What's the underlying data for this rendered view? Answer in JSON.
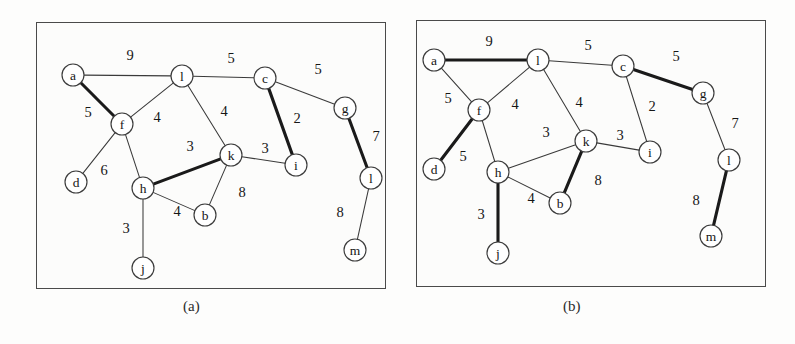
{
  "figure": {
    "title_a": "(a)",
    "title_b": "(b)",
    "node_radius": 11,
    "colors": {
      "edge_thin": "#3a3a3a",
      "edge_bold": "#1a1a1a",
      "node_fill": "#ffffff",
      "node_stroke": "#3b3b3b",
      "panel_border": "#4a4a4a",
      "background": "#fdfdfc"
    }
  },
  "chart_data": {
    "type": "diagram",
    "panels": [
      {
        "id": "a",
        "caption": "(a)",
        "nodes": [
          {
            "id": "a",
            "label": "a",
            "x": 73,
            "y": 75
          },
          {
            "id": "l",
            "label": "l",
            "x": 182,
            "y": 76
          },
          {
            "id": "c",
            "label": "c",
            "x": 265,
            "y": 78
          },
          {
            "id": "g",
            "label": "g",
            "x": 345,
            "y": 108
          },
          {
            "id": "f",
            "label": "f",
            "x": 122,
            "y": 124
          },
          {
            "id": "k",
            "label": "k",
            "x": 231,
            "y": 155
          },
          {
            "id": "i",
            "label": "i",
            "x": 296,
            "y": 165
          },
          {
            "id": "d",
            "label": "d",
            "x": 76,
            "y": 182
          },
          {
            "id": "h",
            "label": "h",
            "x": 143,
            "y": 188
          },
          {
            "id": "l2",
            "label": "l",
            "x": 371,
            "y": 178
          },
          {
            "id": "b",
            "label": "b",
            "x": 205,
            "y": 215
          },
          {
            "id": "m",
            "label": "m",
            "x": 355,
            "y": 250
          },
          {
            "id": "j",
            "label": "j",
            "x": 143,
            "y": 268
          }
        ],
        "edges": [
          {
            "from": "a",
            "to": "l",
            "weight": 9,
            "bold": false,
            "lx": 130,
            "ly": 55
          },
          {
            "from": "l",
            "to": "c",
            "weight": 5,
            "bold": false,
            "lx": 231,
            "ly": 58
          },
          {
            "from": "c",
            "to": "g",
            "weight": 5,
            "bold": false,
            "lx": 318,
            "ly": 69
          },
          {
            "from": "a",
            "to": "f",
            "weight": 5,
            "bold": true,
            "lx": 88,
            "ly": 112
          },
          {
            "from": "f",
            "to": "l",
            "weight": 4,
            "bold": false,
            "lx": 157,
            "ly": 117
          },
          {
            "from": "l",
            "to": "k",
            "weight": 4,
            "bold": false,
            "lx": 224,
            "ly": 111
          },
          {
            "from": "c",
            "to": "i",
            "weight": 2,
            "bold": true,
            "lx": 297,
            "ly": 118
          },
          {
            "from": "g",
            "to": "l2",
            "weight": 7,
            "bold": true,
            "lx": 376,
            "ly": 136
          },
          {
            "from": "f",
            "to": "d",
            "weight": 6,
            "bold": false,
            "lx": 104,
            "ly": 170
          },
          {
            "from": "f",
            "to": "h",
            "weight": 4,
            "bold": false,
            "lx": 157,
            "ly": 117
          },
          {
            "from": "h",
            "to": "k",
            "weight": 3,
            "bold": true,
            "lx": 190,
            "ly": 146
          },
          {
            "from": "k",
            "to": "i",
            "weight": 3,
            "bold": false,
            "lx": 265,
            "ly": 148
          },
          {
            "from": "k",
            "to": "b",
            "weight": 8,
            "bold": false,
            "lx": 242,
            "ly": 192
          },
          {
            "from": "h",
            "to": "b",
            "weight": 4,
            "bold": false,
            "lx": 177,
            "ly": 211
          },
          {
            "from": "h",
            "to": "j",
            "weight": 3,
            "bold": false,
            "lx": 126,
            "ly": 228
          },
          {
            "from": "l2",
            "to": "m",
            "weight": 8,
            "bold": false,
            "lx": 340,
            "ly": 212
          }
        ],
        "bold_edges": [
          "a-f",
          "c-i",
          "g-l2",
          "h-k"
        ]
      },
      {
        "id": "b",
        "caption": "(b)",
        "nodes": [
          {
            "id": "a",
            "label": "a",
            "x": 434,
            "y": 60
          },
          {
            "id": "l",
            "label": "l",
            "x": 538,
            "y": 60
          },
          {
            "id": "c",
            "label": "c",
            "x": 623,
            "y": 66
          },
          {
            "id": "g",
            "label": "g",
            "x": 703,
            "y": 93
          },
          {
            "id": "f",
            "label": "f",
            "x": 479,
            "y": 110
          },
          {
            "id": "k",
            "label": "k",
            "x": 586,
            "y": 141
          },
          {
            "id": "i",
            "label": "i",
            "x": 650,
            "y": 152
          },
          {
            "id": "l2",
            "label": "l",
            "x": 729,
            "y": 160
          },
          {
            "id": "d",
            "label": "d",
            "x": 434,
            "y": 169
          },
          {
            "id": "h",
            "label": "h",
            "x": 498,
            "y": 172
          },
          {
            "id": "b",
            "label": "b",
            "x": 560,
            "y": 203
          },
          {
            "id": "m",
            "label": "m",
            "x": 711,
            "y": 236
          },
          {
            "id": "j",
            "label": "j",
            "x": 498,
            "y": 253
          }
        ],
        "edges": [
          {
            "from": "a",
            "to": "l",
            "weight": 9,
            "bold": true,
            "lx": 489,
            "ly": 41
          },
          {
            "from": "l",
            "to": "c",
            "weight": 5,
            "bold": false,
            "lx": 588,
            "ly": 45
          },
          {
            "from": "c",
            "to": "g",
            "weight": 5,
            "bold": true,
            "lx": 676,
            "ly": 56
          },
          {
            "from": "a",
            "to": "f",
            "weight": 5,
            "bold": false,
            "lx": 448,
            "ly": 98
          },
          {
            "from": "f",
            "to": "l",
            "weight": 4,
            "bold": false,
            "lx": 515,
            "ly": 104
          },
          {
            "from": "l",
            "to": "k",
            "weight": 4,
            "bold": false,
            "lx": 579,
            "ly": 102
          },
          {
            "from": "c",
            "to": "i",
            "weight": 2,
            "bold": false,
            "lx": 652,
            "ly": 106
          },
          {
            "from": "g",
            "to": "l2",
            "weight": 7,
            "bold": false,
            "lx": 735,
            "ly": 123
          },
          {
            "from": "f",
            "to": "d",
            "weight": 5,
            "bold": true,
            "lx": 463,
            "ly": 156
          },
          {
            "from": "f",
            "to": "h",
            "weight": 4,
            "bold": false,
            "lx": 515,
            "ly": 104
          },
          {
            "from": "h",
            "to": "k",
            "weight": 3,
            "bold": false,
            "lx": 546,
            "ly": 132
          },
          {
            "from": "k",
            "to": "i",
            "weight": 3,
            "bold": false,
            "lx": 620,
            "ly": 135
          },
          {
            "from": "k",
            "to": "b",
            "weight": 8,
            "bold": true,
            "lx": 598,
            "ly": 180
          },
          {
            "from": "h",
            "to": "b",
            "weight": 4,
            "bold": false,
            "lx": 531,
            "ly": 198
          },
          {
            "from": "h",
            "to": "j",
            "weight": 3,
            "bold": true,
            "lx": 481,
            "ly": 214
          },
          {
            "from": "l2",
            "to": "m",
            "weight": 8,
            "bold": true,
            "lx": 696,
            "ly": 200
          }
        ],
        "bold_edges": [
          "a-l",
          "c-g",
          "f-d",
          "k-b",
          "h-j",
          "l2-m"
        ]
      }
    ]
  }
}
